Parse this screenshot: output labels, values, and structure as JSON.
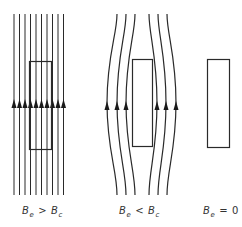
{
  "figure": {
    "type": "meissner-effect-field-lines",
    "stroke_color": "#2a2a2a",
    "panels": [
      {
        "id": "panel-1",
        "label": {
          "base": "B",
          "sub1": "e",
          "op": ">",
          "base2": "B",
          "sub2": "c"
        },
        "description": "Field lines pass straight through the sample",
        "field_lines": 10,
        "arrow_direction": "up"
      },
      {
        "id": "panel-2",
        "label": {
          "base": "B",
          "sub1": "e",
          "op": "<",
          "base2": "B",
          "sub2": "c"
        },
        "description": "Field lines are expelled and curve around the sample",
        "field_lines": 6,
        "arrow_direction": "up"
      },
      {
        "id": "panel-3",
        "label": {
          "base": "B",
          "sub1": "e",
          "op": "=",
          "value": "0"
        },
        "description": "No external field",
        "field_lines": 0
      }
    ]
  }
}
